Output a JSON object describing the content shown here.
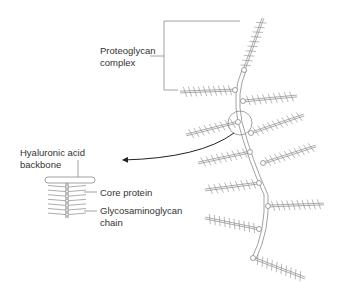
{
  "diagram": {
    "type": "biological-structure",
    "labels": {
      "proteoglycan_complex": "Proteoglycan\ncomplex",
      "hyaluronic_acid_backbone": "Hyaluronic acid\nbackbone",
      "core_protein": "Core protein",
      "glycosaminoglycan_chain": "Glycosaminoglycan\nchain"
    },
    "colors": {
      "line": "#8a8a8a",
      "text": "#333333",
      "arrow": "#222222",
      "background": "#ffffff"
    },
    "structure": {
      "branches_count": 11,
      "detail_inset": "magnified hyaluronic acid backbone with core protein and glycosaminoglycan chains"
    }
  }
}
